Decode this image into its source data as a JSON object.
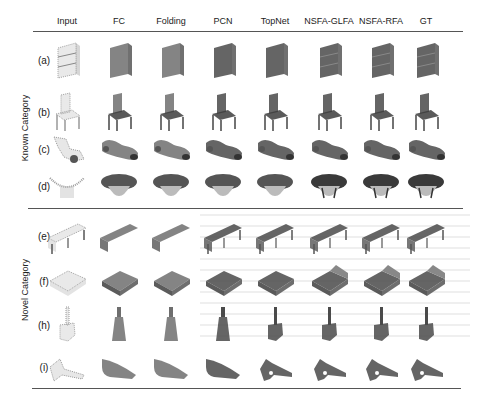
{
  "figure": {
    "columns": [
      {
        "label": "Input",
        "x": 67
      },
      {
        "label": "FC",
        "x": 119
      },
      {
        "label": "Folding",
        "x": 171
      },
      {
        "label": "PCN",
        "x": 223
      },
      {
        "label": "TopNet",
        "x": 275
      },
      {
        "label": "NSFA-GLFA",
        "x": 329
      },
      {
        "label": "NSFA-RFA",
        "x": 381
      },
      {
        "label": "GT",
        "x": 426
      }
    ],
    "groups": [
      {
        "label": "Known Category",
        "center_y": 128
      },
      {
        "label": "Novel Category",
        "center_y": 290
      }
    ],
    "rows": [
      {
        "label": "(a)",
        "object": "bookshelf",
        "y": 60
      },
      {
        "label": "(b)",
        "object": "chair",
        "y": 112
      },
      {
        "label": "(c)",
        "object": "car",
        "y": 149
      },
      {
        "label": "(d)",
        "object": "lamp",
        "y": 186
      },
      {
        "label": "(e)",
        "object": "bench",
        "y": 236
      },
      {
        "label": "(f)",
        "object": "bed",
        "y": 281
      },
      {
        "label": "(h)",
        "object": "guitar",
        "y": 325
      },
      {
        "label": "(i)",
        "object": "pistol",
        "y": 367
      }
    ],
    "colors": {
      "input_points": "#b9b9b9",
      "output_dark": "#4a4a4a",
      "output_mid": "#6e6e6e",
      "rule": "#555555"
    }
  }
}
